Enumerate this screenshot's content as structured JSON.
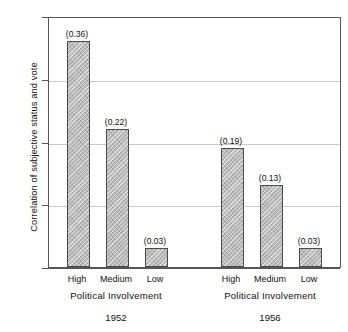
{
  "chart_data": {
    "type": "bar",
    "title": "",
    "subtitle": "",
    "xlabel": "Political Involvement",
    "ylabel": "Correlation of subjective status and vote",
    "ylim": [
      0.0,
      0.4
    ],
    "yticks": [
      "0.00",
      "0.10",
      "0.20",
      "0.30",
      "0.40"
    ],
    "ytick_values": [
      0.0,
      0.1,
      0.2,
      0.3,
      0.4
    ],
    "grid": true,
    "grid_axis": "y",
    "legend": false,
    "categories": [
      "High",
      "Medium",
      "Low"
    ],
    "groups": [
      {
        "name": "1952",
        "axis_label": "Political Involvement",
        "categories": [
          "High",
          "Medium",
          "Low"
        ],
        "values": [
          0.36,
          0.22,
          0.03
        ],
        "value_labels": [
          "(0.36)",
          "(0.22)",
          "(0.03)"
        ]
      },
      {
        "name": "1956",
        "axis_label": "Political Involvement",
        "categories": [
          "High",
          "Medium",
          "Low"
        ],
        "values": [
          0.19,
          0.13,
          0.03
        ],
        "value_labels": [
          "(0.19)",
          "(0.13)",
          "(0.03)"
        ]
      }
    ],
    "bar_color": "#b9b9b9",
    "bar_edge_color": "#4a4a4a",
    "grid_color": "#c9c9c9",
    "axis_color": "#555555",
    "background": "#ffffff"
  },
  "axis": {
    "y_title": "Correlation of subjective status and vote",
    "ticks": [
      {
        "label": "0.40",
        "value": 0.4
      },
      {
        "label": "0.30",
        "value": 0.3
      },
      {
        "label": "0.20",
        "value": 0.2
      },
      {
        "label": "0.10",
        "value": 0.1
      },
      {
        "label": "0.00",
        "value": 0.0
      }
    ]
  },
  "bars": [
    {
      "id": "g1-high",
      "group": "1952",
      "category": "High",
      "value": 0.36,
      "label": "(0.36)"
    },
    {
      "id": "g1-medium",
      "group": "1952",
      "category": "Medium",
      "value": 0.22,
      "label": "(0.22)"
    },
    {
      "id": "g1-low",
      "group": "1952",
      "category": "Low",
      "value": 0.03,
      "label": "(0.03)"
    },
    {
      "id": "g2-high",
      "group": "1956",
      "category": "High",
      "value": 0.19,
      "label": "(0.19)"
    },
    {
      "id": "g2-medium",
      "group": "1956",
      "category": "Medium",
      "value": 0.13,
      "label": "(0.13)"
    },
    {
      "id": "g2-low",
      "group": "1956",
      "category": "Low",
      "value": 0.03,
      "label": "(0.03)"
    }
  ],
  "group_axis_labels": [
    {
      "text": "Political Involvement"
    },
    {
      "text": "Political Involvement"
    }
  ],
  "group_year_labels": [
    {
      "text": "1952"
    },
    {
      "text": "1956"
    }
  ]
}
